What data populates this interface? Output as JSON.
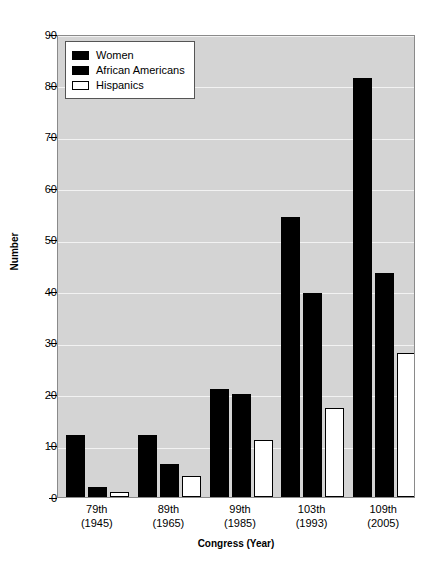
{
  "chart_data": {
    "type": "bar",
    "title": "",
    "xlabel": "Congress (Year)",
    "ylabel": "Number",
    "categories": [
      "79th\n(1945)",
      "89th\n(1965)",
      "99th\n(1985)",
      "103th\n(1993)",
      "109th\n(2005)"
    ],
    "category_lines": [
      {
        "line1": "79th",
        "line2": "(1945)"
      },
      {
        "line1": "89th",
        "line2": "(1965)"
      },
      {
        "line1": "99th",
        "line2": "(1985)"
      },
      {
        "line1": "103th",
        "line2": "(1993)"
      },
      {
        "line1": "109th",
        "line2": "(2005)"
      }
    ],
    "series": [
      {
        "name": "Women",
        "values": [
          12,
          12,
          21,
          54.5,
          81.5
        ],
        "style": "solid-black"
      },
      {
        "name": "African Americans",
        "values": [
          2,
          6.5,
          20,
          39.7,
          43.5
        ],
        "style": "solid-black"
      },
      {
        "name": "Hispanics",
        "values": [
          1,
          4,
          11,
          17.3,
          28
        ],
        "style": "open-white"
      }
    ],
    "ylim": [
      0,
      90
    ],
    "yticks": [
      0,
      10,
      20,
      30,
      40,
      50,
      60,
      70,
      80,
      90
    ],
    "ytick_labels": [
      "0",
      "10",
      "20",
      "30",
      "40",
      "50",
      "60",
      "70",
      "80",
      "90"
    ],
    "grid": true,
    "legend_position": "upper left",
    "plot_background": "#d4d4d4",
    "gridline_color": "#f2f2f2",
    "bar_color": "#000000",
    "open_bar_color": "#ffffff",
    "figure_background": "#ffffff"
  },
  "legend": {
    "entries": [
      {
        "label": "Women"
      },
      {
        "label": "African Americans"
      },
      {
        "label": "Hispanics"
      }
    ]
  }
}
